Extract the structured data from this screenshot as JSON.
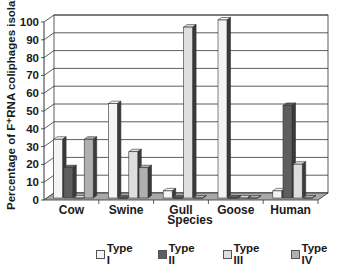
{
  "chart_data": {
    "type": "bar",
    "style": "3d-clustered-column",
    "title": "",
    "xlabel": "Species",
    "ylabel": "Percentage of F+RNA coliphages isolated",
    "ylabel_display": "Percentage of F⁺RNA coliphages isolated",
    "ylim": [
      0,
      100
    ],
    "yticks": [
      0,
      10,
      20,
      30,
      40,
      50,
      60,
      70,
      80,
      90,
      100
    ],
    "grid": true,
    "legend_position": "bottom",
    "categories": [
      "Cow",
      "Swine",
      "Gull",
      "Goose",
      "Human"
    ],
    "series": [
      {
        "name": "Type I",
        "color": "#f4f4f4",
        "values": [
          33,
          53,
          4,
          100,
          4
        ]
      },
      {
        "name": "Type II",
        "color": "#5e5e5e",
        "values": [
          17,
          0,
          0,
          0,
          52
        ]
      },
      {
        "name": "Type III",
        "color": "#dedede",
        "values": [
          0,
          26,
          96,
          0,
          19
        ]
      },
      {
        "name": "Type IV",
        "color": "#b0b0b0",
        "values": [
          33,
          17,
          0,
          0,
          0
        ]
      }
    ]
  },
  "legend": {
    "items": [
      {
        "label": "Type I",
        "color": "#f4f4f4"
      },
      {
        "label": "Type II",
        "color": "#5e5e5e"
      },
      {
        "label": "Type III",
        "color": "#dedede"
      },
      {
        "label": "Type IV",
        "color": "#b0b0b0"
      }
    ]
  }
}
